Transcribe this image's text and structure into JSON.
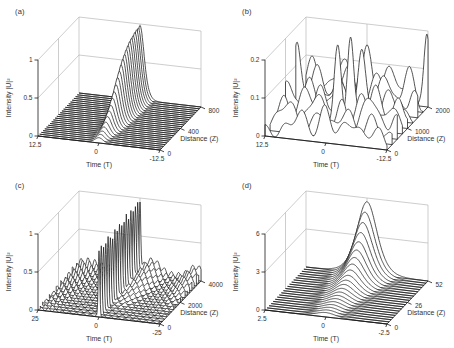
{
  "figure": {
    "background": "#ffffff",
    "line_color": "#1a1a1a",
    "grid_color": "#b7b7b7",
    "tick_color": "#333333"
  },
  "chart_data": [
    {
      "id": "a",
      "label": "(a)",
      "type": "line",
      "subtype": "waterfall3d",
      "xlabel": "Time (T)",
      "ylabel": "Distance (Z)",
      "zlabel": "Intensity |U|²",
      "x_ticks": [
        "12.5",
        "0",
        "-12.5"
      ],
      "x_range": [
        12.5,
        -12.5
      ],
      "y_ticks": [
        "0",
        "400",
        "800"
      ],
      "y_range": [
        0,
        800
      ],
      "z_ticks": [
        "0",
        "0.5",
        "1"
      ],
      "z_range": [
        0,
        1
      ],
      "grid": true,
      "model": {
        "kind": "growing_soliton",
        "center": 0,
        "pulse_width": 1.15,
        "peak_amplitudes": [
          0.07,
          0.09,
          0.11,
          0.14,
          0.18,
          0.23,
          0.28,
          0.33,
          0.4,
          0.46,
          0.53,
          0.6,
          0.66,
          0.72,
          0.77,
          0.81,
          0.85,
          0.88,
          0.91,
          0.93,
          0.94,
          0.96,
          0.97,
          0.97,
          0.98
        ]
      }
    },
    {
      "id": "b",
      "label": "(b)",
      "type": "line",
      "subtype": "waterfall3d",
      "xlabel": "Time (T)",
      "ylabel": "Distance (Z)",
      "zlabel": "Intensity |U|²",
      "x_ticks": [
        "12.5",
        "0",
        "-12.5"
      ],
      "x_range": [
        12.5,
        -12.5
      ],
      "y_ticks": [
        "0",
        "1000",
        "2000"
      ],
      "y_range": [
        0,
        2000
      ],
      "z_ticks": [
        "0",
        "0.1",
        "0.2"
      ],
      "z_range": [
        0,
        0.2
      ],
      "grid": true,
      "model": {
        "kind": "chaotic_bumps",
        "ripple_amp": 0.015,
        "ripple_freq": 1.6,
        "phases": [
          0.5,
          2.1,
          3.8,
          1.2,
          4.9,
          0.2,
          2.9,
          5.5,
          1.7
        ],
        "traces": [
          [
            [
              5.5,
              0.055,
              2.2
            ],
            [
              0,
              0.075,
              1.6
            ],
            [
              -5,
              0.05,
              2.0
            ],
            [
              -10,
              0.035,
              1.8
            ]
          ],
          [
            [
              9,
              0.07,
              2.0
            ],
            [
              2,
              0.05,
              1.8
            ],
            [
              -3,
              0.065,
              1.7
            ],
            [
              -8.5,
              0.045,
              2.0
            ]
          ],
          [
            [
              11,
              0.055,
              1.6
            ],
            [
              4,
              0.085,
              1.8
            ],
            [
              -1,
              0.06,
              1.5
            ],
            [
              -7,
              0.095,
              1.9
            ],
            [
              -12,
              0.05,
              1.2
            ]
          ],
          [
            [
              7,
              0.075,
              1.9
            ],
            [
              0.8,
              0.19,
              1.0
            ],
            [
              -4.5,
              0.07,
              1.8
            ],
            [
              -10,
              0.055,
              1.7
            ]
          ],
          [
            [
              12,
              0.085,
              1.4
            ],
            [
              5,
              0.065,
              1.6
            ],
            [
              -0.8,
              0.215,
              0.9
            ],
            [
              -6,
              0.075,
              1.9
            ],
            [
              -11,
              0.06,
              1.4
            ]
          ],
          [
            [
              8.5,
              0.06,
              1.8
            ],
            [
              2.5,
              0.085,
              1.4
            ],
            [
              -2,
              0.165,
              1.1
            ],
            [
              -8,
              0.06,
              1.7
            ]
          ],
          [
            [
              12.3,
              0.155,
              1.0
            ],
            [
              4,
              0.06,
              1.8
            ],
            [
              -1,
              0.075,
              1.5
            ],
            [
              -6,
              0.085,
              1.9
            ],
            [
              -11.5,
              0.055,
              1.2
            ]
          ],
          [
            [
              9,
              0.065,
              1.7
            ],
            [
              3,
              0.095,
              1.4
            ],
            [
              -3.5,
              0.07,
              1.8
            ],
            [
              -9.5,
              0.095,
              1.5
            ]
          ],
          [
            [
              11,
              0.075,
              1.5
            ],
            [
              5,
              0.085,
              1.8
            ],
            [
              0,
              0.115,
              1.4
            ],
            [
              -5,
              0.075,
              1.9
            ],
            [
              -12.3,
              0.165,
              0.8
            ]
          ]
        ]
      }
    },
    {
      "id": "c",
      "label": "(c)",
      "type": "line",
      "subtype": "waterfall3d",
      "xlabel": "Time (T)",
      "ylabel": "Distance (Z)",
      "zlabel": "Intensity |U|²",
      "x_ticks": [
        "25",
        "0",
        "-25"
      ],
      "x_range": [
        25,
        -25
      ],
      "y_ticks": [
        "0",
        "2000",
        "4000"
      ],
      "y_range": [
        0,
        4000
      ],
      "z_ticks": [
        "0",
        "0.5",
        "1"
      ],
      "z_range": [
        0,
        1
      ],
      "grid": true,
      "model": {
        "kind": "spike_on_ripples",
        "spike_center": 0,
        "spike_width": 0.45,
        "spike_amplitudes": [
          0.86,
          0.88,
          0.84,
          0.87,
          0.9,
          0.85,
          0.83,
          0.88,
          0.86,
          0.89,
          0.84,
          0.87,
          0.9,
          0.85,
          0.88,
          0.86,
          0.89,
          0.87,
          0.9
        ],
        "ripple_base": 0.022,
        "ripple_growth": 0.05,
        "ripple_freq": 2.2,
        "phases": [
          0.0,
          1.7,
          3.1,
          4.6,
          0.9,
          2.4,
          5.2,
          1.3,
          3.9,
          0.4,
          2.9,
          5.7,
          1.9,
          4.3,
          0.7,
          3.4,
          5.9,
          2.2,
          4.9
        ],
        "hump": {
          "center": -5,
          "width": 4.5,
          "max": 0.16
        },
        "edge_hump": {
          "center": -23,
          "width": 4,
          "max": 0.14
        }
      }
    },
    {
      "id": "d",
      "label": "(d)",
      "type": "line",
      "subtype": "waterfall3d",
      "xlabel": "Time (T)",
      "ylabel": "Distance (Z)",
      "zlabel": "Intensity |U|²",
      "x_ticks": [
        "2.5",
        "0",
        "-2.5"
      ],
      "x_range": [
        2.5,
        -2.5
      ],
      "y_ticks": [
        "0",
        "26",
        "52"
      ],
      "y_range": [
        0,
        52
      ],
      "z_ticks": [
        "0",
        "3",
        "6"
      ],
      "z_range": [
        0,
        6
      ],
      "grid": true,
      "model": {
        "kind": "growing_soliton",
        "center": 0,
        "pulse_width": 0.55,
        "peak_amplitudes": [
          0.35,
          0.38,
          0.42,
          0.47,
          0.53,
          0.6,
          0.68,
          0.78,
          0.9,
          1.04,
          1.21,
          1.42,
          1.67,
          1.97,
          2.32,
          2.74,
          3.22,
          3.78,
          4.4,
          5.05,
          5.7
        ]
      }
    }
  ]
}
